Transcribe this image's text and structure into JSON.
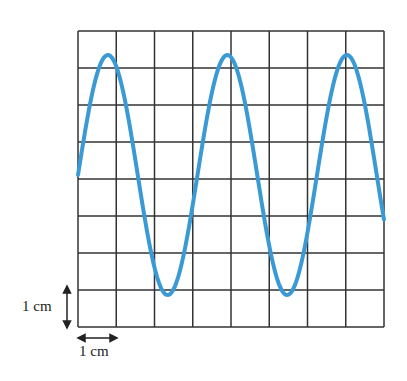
{
  "figure": {
    "type": "oscilloscope-grid-waveform",
    "grid": {
      "columns": 8,
      "rows": 8,
      "cell_size_label": "1 cm",
      "line_color": "#333333"
    },
    "wave": {
      "color": "#3a9ad6",
      "peaks_visible": 3,
      "troughs_visible": 2,
      "amplitude_cm": 3.2,
      "period_cm": 3.1
    },
    "scale": {
      "vertical_label": "1 cm",
      "horizontal_label": "1 cm"
    }
  }
}
